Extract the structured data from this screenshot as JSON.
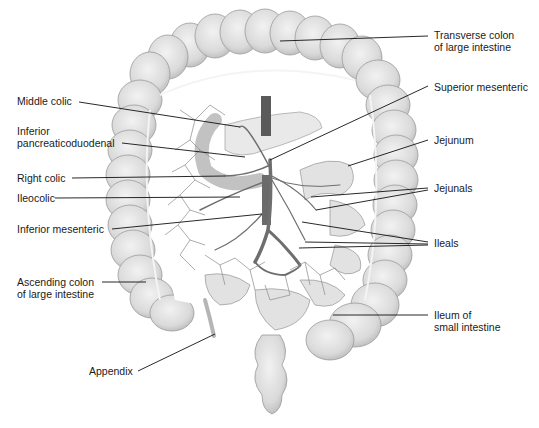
{
  "figure": {
    "colors": {
      "background": "#ffffff",
      "organ_fill": "#e4e4e4",
      "organ_shade": "#c8c8c8",
      "organ_outline": "#9a9a9a",
      "vessel": "#6e6e6e",
      "aorta": "#5a5a5a",
      "leader_line": "#111111",
      "text": "#1a1a1a"
    }
  },
  "labels": {
    "left": [
      {
        "id": "middle-colic",
        "text": "Middle colic",
        "x": 17,
        "y": 95,
        "line": [
          79,
          102,
          240,
          127
        ]
      },
      {
        "id": "inferior-pancreaticoduodenal",
        "text": "Inferior\npancreaticoduodenal",
        "x": 17,
        "y": 125,
        "line": [
          122,
          143,
          245,
          157
        ]
      },
      {
        "id": "right-colic",
        "text": "Right colic",
        "x": 17,
        "y": 172,
        "line": [
          72,
          178,
          225,
          176
        ]
      },
      {
        "id": "ileocolic",
        "text": "Ileocolic",
        "x": 17,
        "y": 192,
        "line": [
          55,
          198,
          240,
          197
        ]
      },
      {
        "id": "inferior-mesenteric",
        "text": "Inferior mesenteric",
        "x": 17,
        "y": 223,
        "line": [
          112,
          229,
          262,
          214
        ]
      },
      {
        "id": "ascending-colon",
        "text": "Ascending colon\nof large intestine",
        "x": 17,
        "y": 276,
        "line": [
          102,
          282,
          146,
          282
        ]
      },
      {
        "id": "appendix",
        "text": "Appendix",
        "x": 89,
        "y": 365,
        "line": [
          138,
          371,
          215,
          334
        ]
      }
    ],
    "right": [
      {
        "id": "transverse-colon",
        "text": "Transverse colon\nof large intestine",
        "x": 434,
        "y": 29,
        "lines": [
          [
            280,
            41,
            428,
            36
          ]
        ]
      },
      {
        "id": "superior-mesenteric",
        "text": "Superior mesenteric",
        "x": 434,
        "y": 81,
        "lines": [
          [
            270,
            160,
            428,
            86
          ]
        ]
      },
      {
        "id": "jejunum",
        "text": "Jejunum",
        "x": 434,
        "y": 134,
        "lines": [
          [
            348,
            166,
            428,
            140
          ]
        ]
      },
      {
        "id": "jejunals",
        "text": "Jejunals",
        "x": 434,
        "y": 182,
        "lines": [
          [
            311,
            197,
            428,
            188
          ],
          [
            316,
            210,
            428,
            190
          ]
        ]
      },
      {
        "id": "ileals",
        "text": "Ileals",
        "x": 434,
        "y": 237,
        "lines": [
          [
            302,
            222,
            428,
            242
          ],
          [
            305,
            242,
            428,
            244
          ],
          [
            299,
            248,
            428,
            245
          ]
        ]
      },
      {
        "id": "ileum",
        "text": "Ileum of\nsmall intestine",
        "x": 434,
        "y": 309,
        "lines": [
          [
            333,
            315,
            428,
            315
          ]
        ]
      }
    ]
  }
}
